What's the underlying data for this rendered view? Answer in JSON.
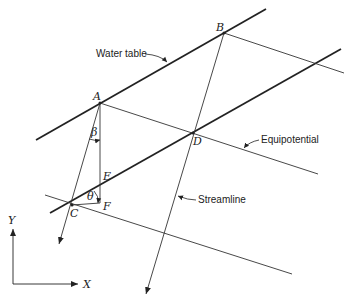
{
  "labels": {
    "water_table": "Water table",
    "equipotential": "Equipotential",
    "streamline": "Streamline"
  },
  "points": {
    "A": "A",
    "B": "B",
    "C": "C",
    "D": "D",
    "E": "E",
    "F": "F"
  },
  "angles": {
    "beta": "β",
    "theta": "θ"
  },
  "axes": {
    "x": "X",
    "y": "Y"
  },
  "colors": {
    "line": "#222222",
    "background": "#ffffff"
  }
}
